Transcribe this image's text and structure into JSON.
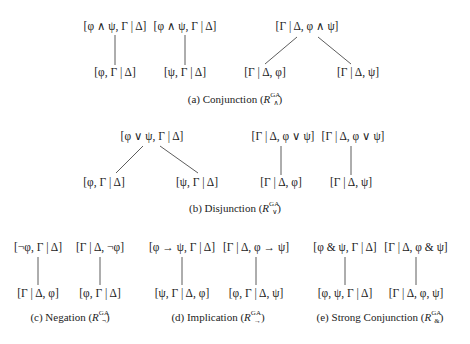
{
  "figures": [
    {
      "id": "a",
      "caption": "(a) Conjunction (",
      "rule_sup": "GA",
      "rule_sub": "∧",
      "caption_end": ")",
      "trees": [
        {
          "root": "[φ ∧ ψ, Γ | Δ]",
          "children": [
            "[φ, Γ | Δ]"
          ]
        },
        {
          "root": "[φ ∧ ψ, Γ | Δ]",
          "children": [
            "[ψ, Γ | Δ]"
          ]
        },
        {
          "root": "[Γ | Δ, φ ∧ ψ]",
          "children": [
            "[Γ | Δ, φ]",
            "[Γ | Δ, ψ]"
          ]
        }
      ]
    },
    {
      "id": "b",
      "caption": "(b) Disjunction (",
      "rule_sup": "GA",
      "rule_sub": "∨",
      "caption_end": ")",
      "trees": [
        {
          "root": "[φ ∨ ψ, Γ | Δ]",
          "children": [
            "[φ, Γ | Δ]",
            "[ψ, Γ | Δ]"
          ]
        },
        {
          "root": "[Γ | Δ, φ ∨ ψ]",
          "children": [
            "[Γ | Δ, φ]"
          ]
        },
        {
          "root": "[Γ | Δ, φ ∨ ψ]",
          "children": [
            "[Γ | Δ, ψ]"
          ]
        }
      ]
    },
    {
      "id": "c",
      "caption": "(c) Negation (",
      "rule_sup": "GA",
      "rule_sub": "¬",
      "caption_end": ")",
      "trees": [
        {
          "root": "[¬φ, Γ | Δ]",
          "children": [
            "[Γ | Δ, φ]"
          ]
        },
        {
          "root": "[Γ | Δ, ¬φ]",
          "children": [
            "[φ, Γ | Δ]"
          ]
        }
      ]
    },
    {
      "id": "d",
      "caption": "(d) Implication (",
      "rule_sup": "GA",
      "rule_sub": "→",
      "caption_end": ")",
      "trees": [
        {
          "root": "[φ → ψ, Γ | Δ]",
          "children": [
            "[ψ, Γ | Δ, φ]"
          ]
        },
        {
          "root": "[Γ | Δ, φ → ψ]",
          "children": [
            "[φ, Γ | Δ, ψ]"
          ]
        }
      ]
    },
    {
      "id": "e",
      "caption": "(e) Strong Conjunction (",
      "rule_sup": "GA",
      "rule_sub": "&",
      "caption_end": ")",
      "trees": [
        {
          "root": "[φ & ψ, Γ | Δ]",
          "children": [
            "[φ, ψ, Γ | Δ]"
          ]
        },
        {
          "root": "[Γ | Δ, φ & ψ]",
          "children": [
            "[Γ | Δ, φ, ψ]"
          ]
        }
      ]
    }
  ],
  "rule_letter": "R"
}
